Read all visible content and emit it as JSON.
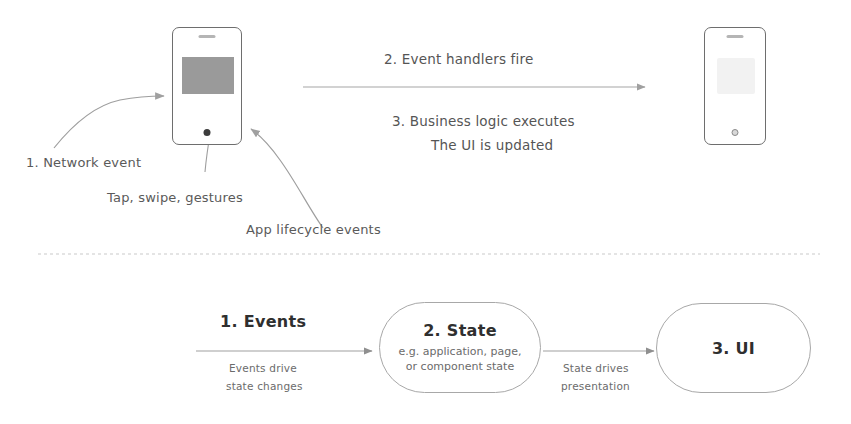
{
  "diagram": {
    "background_color": "#ffffff",
    "ink_color": "#6e6e6e"
  },
  "top_section": {
    "source_phone": {
      "name": "source-phone",
      "screen_content_color": "#9a9a9a",
      "speaker_label": "speaker",
      "home_button_label": "home button"
    },
    "result_phone": {
      "name": "result-phone",
      "screen_content_color": "#f2f2f2",
      "speaker_label": "speaker",
      "home_button_label": "home button"
    },
    "steps": [
      {
        "id": "step-2",
        "text": "2. Event handlers fire"
      },
      {
        "id": "step-3-line-1",
        "text": "3. Business logic executes"
      },
      {
        "id": "step-3-line-2",
        "text": "The UI is updated"
      }
    ],
    "callouts": [
      {
        "id": "network-event",
        "text": "1. Network event"
      },
      {
        "id": "tap-swipe-gestures",
        "text": "Tap, swipe, gestures"
      },
      {
        "id": "app-lifecycle-events",
        "text": "App lifecycle events"
      }
    ]
  },
  "divider": {
    "style": "dashed",
    "color": "#c9c9c9"
  },
  "bottom_flow": {
    "nodes": [
      {
        "id": "events",
        "title": "1. Events",
        "subtitle_lines": [],
        "shape": "plain-text"
      },
      {
        "id": "state",
        "title": "2. State",
        "subtitle_lines": [
          "e.g. application, page,",
          "or component state"
        ],
        "shape": "stadium"
      },
      {
        "id": "ui",
        "title": "3. UI",
        "subtitle_lines": [],
        "shape": "stadium"
      }
    ],
    "edges": [
      {
        "id": "events-to-state",
        "from": "events",
        "to": "state",
        "label_lines": [
          "Events drive",
          "state changes"
        ]
      },
      {
        "id": "state-to-ui",
        "from": "state",
        "to": "ui",
        "label_lines": [
          "State drives",
          "presentation"
        ]
      }
    ]
  }
}
